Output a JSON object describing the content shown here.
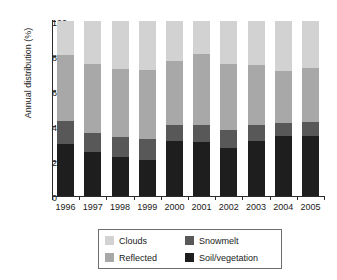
{
  "chart_data": {
    "type": "bar",
    "stacked": true,
    "title": "",
    "xlabel": "",
    "ylabel": "Annual distribution (%)",
    "ylim": [
      0,
      100
    ],
    "yticks": [
      0,
      20,
      40,
      60,
      80,
      100
    ],
    "grid": false,
    "legend_position": "bottom",
    "categories": [
      "1996",
      "1997",
      "1998",
      "1999",
      "2000",
      "2001",
      "2002",
      "2003",
      "2004",
      "2005"
    ],
    "series": [
      {
        "name": "Soil/vegetation",
        "color": "#1e1e1e",
        "values": [
          29.5,
          25.0,
          22.5,
          20.5,
          31.5,
          31.0,
          27.5,
          31.5,
          34.5,
          34.5
        ]
      },
      {
        "name": "Snowmelt",
        "color": "#585858",
        "values": [
          13.5,
          11.0,
          11.5,
          12.0,
          9.0,
          9.5,
          10.0,
          9.0,
          7.5,
          8.0
        ]
      },
      {
        "name": "Reflected",
        "color": "#a8a8a8",
        "values": [
          37.5,
          39.5,
          38.5,
          39.5,
          36.5,
          40.5,
          38.0,
          34.5,
          29.5,
          30.5
        ]
      },
      {
        "name": "Clouds",
        "color": "#d2d2d2",
        "values": [
          19.5,
          24.5,
          27.5,
          28.0,
          23.0,
          19.0,
          24.5,
          25.0,
          28.5,
          27.0
        ]
      }
    ],
    "totals": [
      100,
      100,
      100,
      100,
      100,
      100,
      100,
      100,
      100,
      100
    ],
    "cumulative_tops": {
      "soil_vegetation": [
        29.5,
        25.0,
        22.5,
        20.5,
        31.5,
        31.0,
        27.5,
        31.5,
        34.5,
        34.5
      ],
      "snowmelt": [
        43.0,
        36.0,
        34.0,
        32.5,
        40.5,
        40.5,
        37.5,
        40.5,
        42.0,
        42.5
      ],
      "reflected": [
        80.5,
        75.5,
        72.5,
        72.0,
        77.0,
        81.0,
        75.5,
        75.0,
        71.5,
        73.0
      ],
      "clouds": [
        100,
        100,
        100,
        100,
        100,
        100,
        100,
        100,
        100,
        100
      ]
    }
  },
  "legend": {
    "entries": [
      {
        "label": "Clouds",
        "color": "#d2d2d2"
      },
      {
        "label": "Snowmelt",
        "color": "#585858"
      },
      {
        "label": "Reflected",
        "color": "#a8a8a8"
      },
      {
        "label": "Soil/vegetation",
        "color": "#1e1e1e"
      }
    ]
  },
  "axes": {
    "y_title": "Annual distribution (%)",
    "y_tick_labels": [
      "100",
      "80",
      "60",
      "40",
      "20",
      "0"
    ],
    "x_tick_labels": [
      "1996",
      "1997",
      "1998",
      "1999",
      "2000",
      "2001",
      "2002",
      "2003",
      "2004",
      "2005"
    ]
  }
}
